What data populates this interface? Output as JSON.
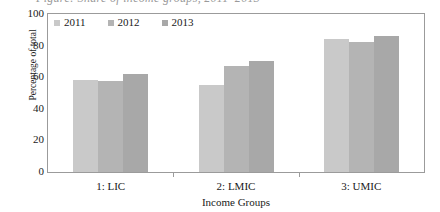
{
  "caption": {
    "text": "Figure: Share of income groups, 2011–2013"
  },
  "chart_data": {
    "type": "bar",
    "title": "",
    "xlabel": "Income Groups",
    "ylabel": "Percentage of total",
    "ylim": [
      0,
      100
    ],
    "yticks": [
      0,
      20,
      40,
      60,
      80,
      100
    ],
    "grid": false,
    "legend_position": "top-left",
    "categories": [
      "1: LIC",
      "2: LMIC",
      "3: UMIC"
    ],
    "series": [
      {
        "name": "2011",
        "color": "#c9c9c9",
        "values": [
          58,
          55,
          84
        ]
      },
      {
        "name": "2012",
        "color": "#b4b4b4",
        "values": [
          57.5,
          67,
          82
        ]
      },
      {
        "name": "2013",
        "color": "#a8a8a8",
        "values": [
          62,
          70,
          86
        ]
      }
    ]
  },
  "axis": {
    "frame_color": "#9b9b9b"
  }
}
